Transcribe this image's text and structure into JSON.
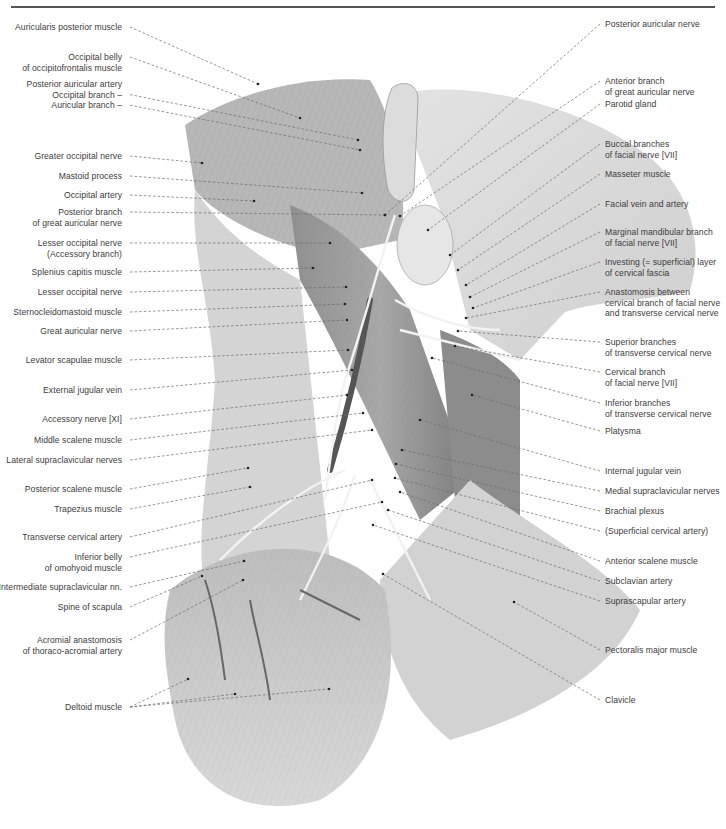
{
  "figure": {
    "colors": {
      "background": "#ffffff",
      "rule": "#555555",
      "label_text": "#3c3c3c",
      "leader": "#6a6a6a",
      "skin": "#d9d9d9",
      "muscle": "#9a9a9a",
      "dark_vessel": "#5a5a5a",
      "nerve": "#eeeeee"
    }
  },
  "labels_left": [
    {
      "lines": [
        "Auricularis posterior muscle"
      ],
      "y": 22,
      "tx": 258,
      "ty": 84
    },
    {
      "lines": [
        "Occipital belly",
        "of occipitofrontalis muscle"
      ],
      "y": 52,
      "tx": 300,
      "ty": 118
    },
    {
      "lines": [
        "Posterior auricular artery",
        "Occipital branch –",
        "Auricular branch –"
      ],
      "y": 79,
      "tx": 358,
      "ty": 140,
      "tx2": 360,
      "ty2": 150,
      "multi_leader_rows": [
        1,
        2
      ]
    },
    {
      "lines": [
        "Greater occipital nerve"
      ],
      "y": 151,
      "tx": 202,
      "ty": 163
    },
    {
      "lines": [
        "Mastoid process"
      ],
      "y": 171,
      "tx": 362,
      "ty": 193
    },
    {
      "lines": [
        "Occipital artery"
      ],
      "y": 190,
      "tx": 254,
      "ty": 201
    },
    {
      "lines": [
        "Posterior branch",
        "of great auricular nerve"
      ],
      "y": 207,
      "tx": 385,
      "ty": 215
    },
    {
      "lines": [
        "Lesser occipital nerve",
        "(Accessory branch)"
      ],
      "y": 238,
      "tx": 330,
      "ty": 243
    },
    {
      "lines": [
        "Splenius capitis muscle"
      ],
      "y": 267,
      "tx": 313,
      "ty": 268
    },
    {
      "lines": [
        "Lesser occipital nerve"
      ],
      "y": 287,
      "tx": 346,
      "ty": 287
    },
    {
      "lines": [
        "Sternocleidomastoid muscle"
      ],
      "y": 307,
      "tx": 345,
      "ty": 304
    },
    {
      "lines": [
        "Great auricular nerve"
      ],
      "y": 326,
      "tx": 347,
      "ty": 320
    },
    {
      "lines": [
        "Levator scapulae muscle"
      ],
      "y": 355,
      "tx": 348,
      "ty": 350
    },
    {
      "lines": [
        "External jugular vein"
      ],
      "y": 385,
      "tx": 352,
      "ty": 370
    },
    {
      "lines": [
        "Accessory nerve [XI]"
      ],
      "y": 414,
      "tx": 347,
      "ty": 395
    },
    {
      "lines": [
        "Middle scalene muscle"
      ],
      "y": 435,
      "tx": 363,
      "ty": 413
    },
    {
      "lines": [
        "Lateral supraclavicular nerves"
      ],
      "y": 455,
      "tx": 372,
      "ty": 430
    },
    {
      "lines": [
        "Posterior scalene muscle"
      ],
      "y": 484,
      "tx": 248,
      "ty": 468
    },
    {
      "lines": [
        "Trapezius muscle"
      ],
      "y": 504,
      "tx": 250,
      "ty": 487
    },
    {
      "lines": [
        "Transverse cervical artery"
      ],
      "y": 532,
      "tx": 372,
      "ty": 480
    },
    {
      "lines": [
        "Inferior belly",
        "of omohyoid muscle"
      ],
      "y": 552,
      "tx": 382,
      "ty": 502
    },
    {
      "lines": [
        "Intermediate supraclavicular nn."
      ],
      "y": 582,
      "tx": 244,
      "ty": 561
    },
    {
      "lines": [
        "Spine of scapula"
      ],
      "y": 602,
      "tx": 202,
      "ty": 576
    },
    {
      "lines": [
        "Acromial anastomosis",
        "of thoraco-acromial artery"
      ],
      "y": 635,
      "tx": 243,
      "ty": 580
    },
    {
      "lines": [
        "Deltoid muscle"
      ],
      "y": 702,
      "tx": 188,
      "ty": 679,
      "tx2": 235,
      "ty2": 694,
      "tx3": 329,
      "ty3": 689
    }
  ],
  "labels_right": [
    {
      "lines": [
        "Posterior auricular nerve"
      ],
      "y": 19,
      "tx": 385,
      "ty": 215
    },
    {
      "lines": [
        "Anterior branch",
        "of great auricular nerve"
      ],
      "y": 76,
      "tx": 400,
      "ty": 216
    },
    {
      "lines": [
        "Parotid gland"
      ],
      "y": 99,
      "tx": 428,
      "ty": 230
    },
    {
      "lines": [
        "Buccal branches",
        "of facial nerve [VII]"
      ],
      "y": 139,
      "tx": 450,
      "ty": 255
    },
    {
      "lines": [
        "Masseter muscle"
      ],
      "y": 169,
      "tx": 458,
      "ty": 270
    },
    {
      "lines": [
        "Facial vein and artery"
      ],
      "y": 199,
      "tx": 466,
      "ty": 285
    },
    {
      "lines": [
        "Marginal mandibular branch",
        "of facial nerve [VII]"
      ],
      "y": 227,
      "tx": 470,
      "ty": 297
    },
    {
      "lines": [
        "Investing (= superficial) layer",
        "of cervical fascia"
      ],
      "y": 257,
      "tx": 473,
      "ty": 308
    },
    {
      "lines": [
        "Anastomosis between",
        "cervical branch of facial nerve",
        "and transverse cervical nerve"
      ],
      "y": 287,
      "tx": 466,
      "ty": 318
    },
    {
      "lines": [
        "Superior branches",
        "of transverse cervical nerve"
      ],
      "y": 337,
      "tx": 458,
      "ty": 331
    },
    {
      "lines": [
        "Cervical branch",
        "of facial nerve [VII]"
      ],
      "y": 367,
      "tx": 455,
      "ty": 346
    },
    {
      "lines": [
        "Inferior branches",
        "of transverse cervical nerve"
      ],
      "y": 398,
      "tx": 432,
      "ty": 358
    },
    {
      "lines": [
        "Platysma"
      ],
      "y": 426,
      "tx": 472,
      "ty": 395
    },
    {
      "lines": [
        "Internal jugular vein"
      ],
      "y": 466,
      "tx": 420,
      "ty": 420
    },
    {
      "lines": [
        "Medial supraclavicular nerves"
      ],
      "y": 486,
      "tx": 402,
      "ty": 450
    },
    {
      "lines": [
        "Brachial plexus"
      ],
      "y": 506,
      "tx": 396,
      "ty": 464
    },
    {
      "lines": [
        "(Superficial cervical artery)"
      ],
      "y": 526,
      "tx": 395,
      "ty": 478
    },
    {
      "lines": [
        "Anterior scalene muscle"
      ],
      "y": 556,
      "tx": 400,
      "ty": 492
    },
    {
      "lines": [
        "Subclavian artery"
      ],
      "y": 576,
      "tx": 388,
      "ty": 510
    },
    {
      "lines": [
        "Suprascapular artery"
      ],
      "y": 596,
      "tx": 373,
      "ty": 525
    },
    {
      "lines": [
        "Pectoralis major muscle"
      ],
      "y": 645,
      "tx": 514,
      "ty": 602
    },
    {
      "lines": [
        "Clavicle"
      ],
      "y": 695,
      "tx": 383,
      "ty": 574
    }
  ]
}
